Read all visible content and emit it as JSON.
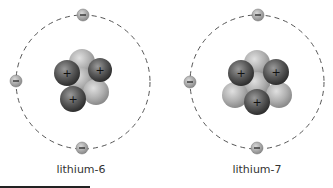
{
  "atoms": [
    {
      "label": "lithium-6",
      "protons": 3,
      "neutrons": 3,
      "electrons": 3,
      "center": [
        83,
        82
      ],
      "orbit_radius": 67
    },
    {
      "label": "lithium-7",
      "protons": 3,
      "neutrons": 4,
      "electrons": 3,
      "center": [
        257,
        82
      ],
      "orbit_radius": 67
    }
  ],
  "symbols": {
    "proton": "+",
    "electron": "−"
  },
  "colors": {
    "proton": "#4a4a4a",
    "neutron": "#a8a8a8",
    "electron": "#9a9a9a",
    "orbit": "#555555"
  }
}
